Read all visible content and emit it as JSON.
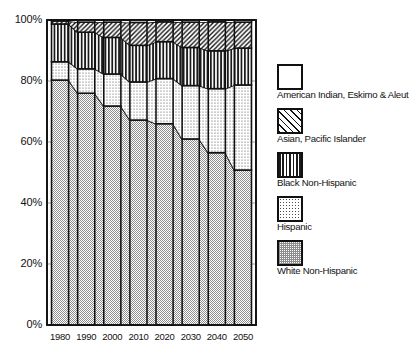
{
  "chart_data": {
    "type": "area",
    "title": "",
    "subtitle": "",
    "xlabel": "",
    "ylabel": "",
    "categories": [
      "1980",
      "1990",
      "2000",
      "2010",
      "2020",
      "2030",
      "2040",
      "2050"
    ],
    "ylim": [
      0,
      100
    ],
    "yticks": [
      "0%",
      "20%",
      "40%",
      "60%",
      "80%",
      "100%"
    ],
    "ytick_values": [
      0,
      20,
      40,
      60,
      80,
      100
    ],
    "grid": false,
    "legend_position": "right",
    "stacking": "percent",
    "series": [
      {
        "name": "White Non-Hispanic",
        "pattern": "check",
        "values": [
          80.3,
          76.0,
          71.8,
          67.2,
          66.0,
          61.0,
          56.5,
          50.8
        ]
      },
      {
        "name": "Hispanic",
        "pattern": "dot",
        "values": [
          6.0,
          8.0,
          10.5,
          12.5,
          14.8,
          17.5,
          21.0,
          27.9
        ]
      },
      {
        "name": "Black Non-Hispanic",
        "pattern": "vertical-lines",
        "values": [
          12.4,
          12.0,
          12.0,
          12.0,
          12.1,
          12.5,
          12.4,
          12.1
        ]
      },
      {
        "name": "Asian, Pacific Islander",
        "pattern": "diagonal-hatch",
        "values": [
          1.0,
          3.3,
          5.0,
          7.5,
          6.5,
          8.3,
          9.5,
          8.5
        ]
      },
      {
        "name": "American Indian, Eskimo & Aleut",
        "pattern": "solid-white",
        "values": [
          0.3,
          0.7,
          0.7,
          0.8,
          0.6,
          0.7,
          0.6,
          0.7
        ]
      }
    ]
  },
  "axis": {
    "y_ticks": [
      {
        "label": "100%",
        "value": 100
      },
      {
        "label": "80%",
        "value": 80
      },
      {
        "label": "60%",
        "value": 60
      },
      {
        "label": "40%",
        "value": 40
      },
      {
        "label": "20%",
        "value": 20
      },
      {
        "label": "0%",
        "value": 0
      }
    ],
    "x_ticks": [
      "1980",
      "1990",
      "2000",
      "2010",
      "2020",
      "2030",
      "2040",
      "2050"
    ]
  },
  "legend": {
    "items": [
      {
        "label": "American Indian, Eskimo & Aleut",
        "pattern": "solid-white"
      },
      {
        "label": "Asian, Pacific Islander",
        "pattern": "diagonal-hatch"
      },
      {
        "label": "Black Non-Hispanic",
        "pattern": "vertical-lines"
      },
      {
        "label": "Hispanic",
        "pattern": "dot"
      },
      {
        "label": "White Non-Hispanic",
        "pattern": "check"
      }
    ]
  },
  "colors": {
    "outline": "#111111",
    "background": "#ffffff",
    "text": "#111111"
  }
}
